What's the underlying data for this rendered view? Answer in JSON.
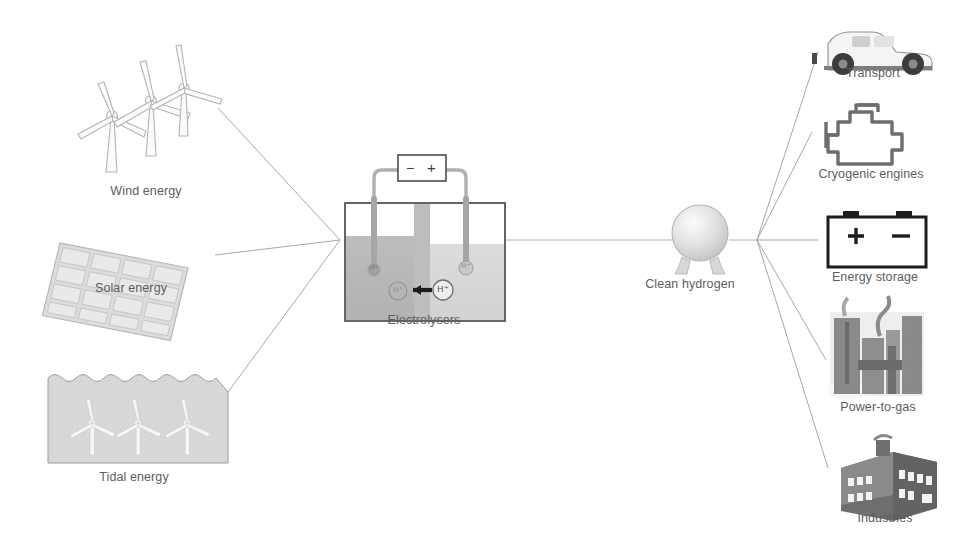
{
  "diagram": {
    "type": "flow-diagram",
    "background_color": "#ffffff",
    "label_color": "#5d5d5d",
    "line_color": "#a8a8a8",
    "inputs": [
      {
        "id": "wind",
        "label": "Wind energy",
        "icon": "wind-turbines-icon"
      },
      {
        "id": "solar",
        "label": "Solar energy",
        "icon": "solar-panel-icon"
      },
      {
        "id": "tidal",
        "label": "Tidal energy",
        "icon": "tidal-turbines-icon"
      }
    ],
    "converter": {
      "id": "electrolysers",
      "label": "Electrolysers",
      "icon": "electrolyser-cell-icon",
      "power_supply": {
        "negative_terminal": "−",
        "positive_terminal": "+"
      },
      "ion_labels": [
        "H⁺",
        "H⁺",
        "H⁺",
        "H⁺"
      ],
      "arrow_direction": "left"
    },
    "carrier": {
      "id": "clean-hydrogen",
      "label": "Clean hydrogen",
      "icon": "spherical-hydrogen-tank-icon"
    },
    "outputs": [
      {
        "id": "transport",
        "label": "Transport",
        "icon": "pickup-truck-icon"
      },
      {
        "id": "cryogenic-engines",
        "label": "Cryogenic engines",
        "icon": "engine-block-icon"
      },
      {
        "id": "energy-storage",
        "label": "Energy storage",
        "icon": "battery-icon",
        "terminals": {
          "positive": "+",
          "negative": "−"
        }
      },
      {
        "id": "power-to-gas",
        "label": "Power-to-gas",
        "icon": "chemical-plant-icon"
      },
      {
        "id": "industries",
        "label": "Industries",
        "icon": "factory-icon"
      }
    ]
  }
}
